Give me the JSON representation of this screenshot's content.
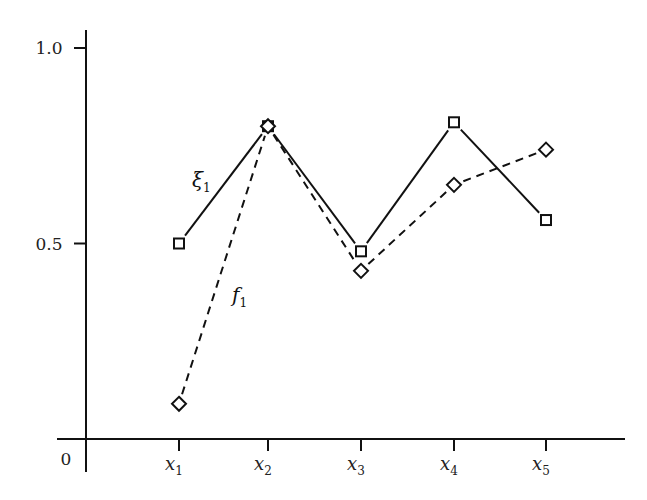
{
  "chart_data": {
    "type": "line",
    "title": "",
    "xlabel": "",
    "ylabel": "",
    "categories": [
      "x1",
      "x2",
      "x3",
      "x4",
      "x5"
    ],
    "x_tick_labels": [
      {
        "base": "x",
        "sub": "1"
      },
      {
        "base": "x",
        "sub": "2"
      },
      {
        "base": "x",
        "sub": "3"
      },
      {
        "base": "x",
        "sub": "4"
      },
      {
        "base": "x",
        "sub": "5"
      }
    ],
    "y_ticks": [
      0.5,
      1.0
    ],
    "y_tick_labels": [
      "0.5",
      "1.0"
    ],
    "origin_label": "0",
    "ylim": [
      0,
      1.0
    ],
    "grid": false,
    "legend": "none (inline labels)",
    "series": [
      {
        "name": "ξ1",
        "label_base": "ξ",
        "label_sub": "1",
        "style": "solid",
        "marker": "square",
        "values": [
          0.5,
          0.8,
          0.48,
          0.81,
          0.56
        ]
      },
      {
        "name": "f1",
        "label_base": "f",
        "label_sub": "1",
        "style": "dashed",
        "marker": "diamond",
        "values": [
          0.09,
          0.8,
          0.43,
          0.65,
          0.74
        ]
      }
    ]
  }
}
